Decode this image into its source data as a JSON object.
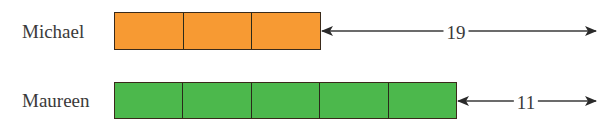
{
  "diagram": {
    "type": "tape-diagram",
    "unit_cell_width_px": 68.7,
    "rows": [
      {
        "label": "Michael",
        "units": 3,
        "fill_color": "#f79a33",
        "difference_label": "19"
      },
      {
        "label": "Maureen",
        "units": 5,
        "fill_color": "#4cb84c",
        "difference_label": "11"
      }
    ],
    "arrow_color": "#2a2a2a"
  }
}
